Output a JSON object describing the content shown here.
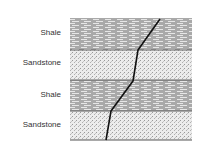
{
  "diagram": {
    "layers": [
      {
        "name": "Shale",
        "type": "shale",
        "top": 18,
        "bottom": 50,
        "label_y": 28
      },
      {
        "name": "Sandstone",
        "type": "sandstone",
        "top": 50,
        "bottom": 80,
        "label_y": 58
      },
      {
        "name": "Shale",
        "type": "shale",
        "top": 80,
        "bottom": 111,
        "label_y": 90
      },
      {
        "name": "Sandstone",
        "type": "sandstone",
        "top": 111,
        "bottom": 140,
        "label_y": 120
      }
    ],
    "block": {
      "left": 70,
      "right": 192
    },
    "fracture_path": [
      [
        160,
        19
      ],
      [
        138,
        50
      ],
      [
        133,
        81
      ],
      [
        111,
        111
      ],
      [
        106,
        140
      ]
    ],
    "colors": {
      "shale_fill": "#a9a9a9",
      "shale_dash": "#ffffff",
      "sandstone_fill": "#e8e8e8",
      "sandstone_dot": "#9a9a9a",
      "boundary": "#555555",
      "fracture": "#111111",
      "label": "#333333"
    }
  }
}
